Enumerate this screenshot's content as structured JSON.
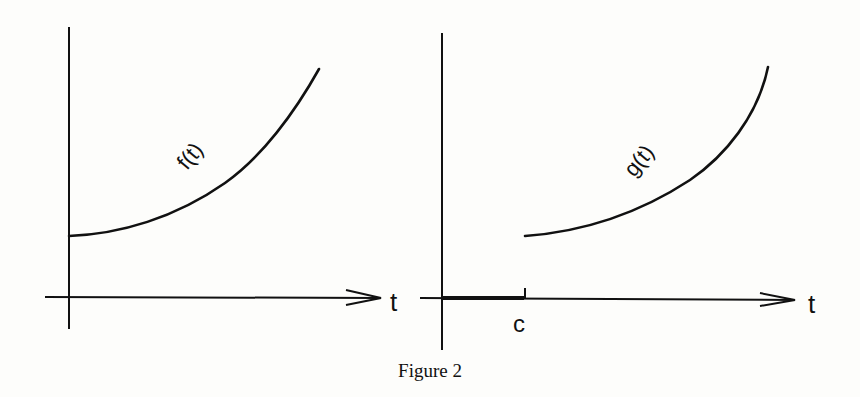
{
  "caption": "Figure 2",
  "left_panel": {
    "curve_label": "f(t)",
    "axis_label": "t"
  },
  "right_panel": {
    "curve_label": "g(t)",
    "axis_label": "t",
    "shift_label": "c"
  },
  "colors": {
    "ink": "#111111",
    "paper": "#fdfdfb"
  }
}
